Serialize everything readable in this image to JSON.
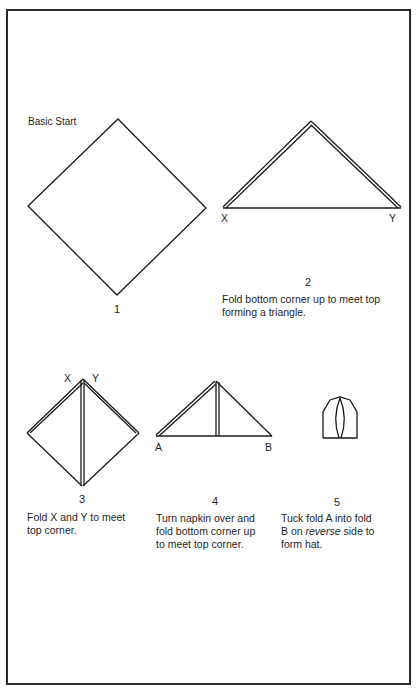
{
  "title": "Basic Start",
  "steps": [
    {
      "number": "1",
      "caption": ""
    },
    {
      "number": "2",
      "caption": "Fold bottom corner up to meet top forming a triangle.",
      "caption_lines": [
        "Fold bottom corner up to meet top",
        "forming a triangle."
      ],
      "labels": {
        "left": "X",
        "right": "Y"
      }
    },
    {
      "number": "3",
      "caption_lines": [
        "Fold X and Y to meet",
        "top corner."
      ],
      "labels": {
        "left": "X",
        "right": "Y"
      }
    },
    {
      "number": "4",
      "caption_lines": [
        "Turn napkin over and",
        "fold bottom corner up",
        "to meet top corner."
      ],
      "labels": {
        "left": "A",
        "right": "B"
      }
    },
    {
      "number": "5",
      "caption_lines": [
        "Tuck fold A into fold",
        "B on",
        "reverse",
        "side to",
        "form hat."
      ]
    }
  ],
  "colors": {
    "line": "#1a1a1a",
    "background": "#ffffff"
  }
}
